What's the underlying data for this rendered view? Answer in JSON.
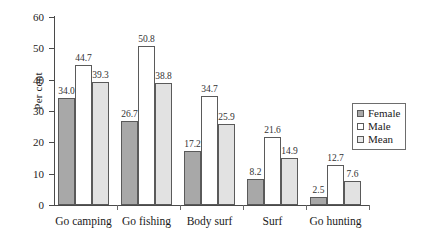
{
  "chart_data": {
    "type": "bar",
    "title": "",
    "xlabel": "",
    "ylabel": "Per cent",
    "ylim": [
      0,
      60
    ],
    "yticks": [
      0,
      10,
      20,
      30,
      40,
      50,
      60
    ],
    "grid": false,
    "legend_position": "right",
    "categories": [
      "Go camping",
      "Go fishing",
      "Body surf",
      "Surf",
      "Go hunting"
    ],
    "series": [
      {
        "name": "Female",
        "color": "#a8a8a8",
        "values": [
          34.0,
          26.7,
          17.2,
          8.2,
          2.5
        ]
      },
      {
        "name": "Male",
        "color": "#ffffff",
        "values": [
          44.7,
          50.8,
          34.7,
          21.6,
          12.7
        ]
      },
      {
        "name": "Mean",
        "color": "#e2e2e2",
        "values": [
          39.3,
          38.8,
          25.9,
          14.9,
          7.6
        ]
      }
    ],
    "value_labels": [
      [
        "34.0",
        "44.7",
        "39.3"
      ],
      [
        "26.7",
        "50.8",
        "38.8"
      ],
      [
        "17.2",
        "34.7",
        "25.9"
      ],
      [
        "8.2",
        "21.6",
        "14.9"
      ],
      [
        "2.5",
        "12.7",
        "7.6"
      ]
    ],
    "ytick_labels": [
      "0",
      "10",
      "20",
      "30",
      "40",
      "50",
      "60"
    ]
  },
  "legend": {
    "items": [
      {
        "label": "Female",
        "swatch": "female"
      },
      {
        "label": "Male",
        "swatch": "male"
      },
      {
        "label": "Mean",
        "swatch": "mean"
      }
    ]
  }
}
